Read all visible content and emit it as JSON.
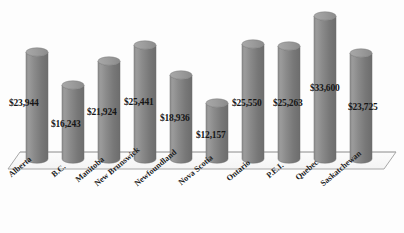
{
  "chart_data": {
    "type": "bar",
    "title": "",
    "subtitle": "",
    "xlabel": "",
    "ylabel": "",
    "grid": false,
    "legend": false,
    "legend_position": "none",
    "bar_style": "3d-cylinder",
    "bar_color": "#808080",
    "bar_top_color": "#9a9a9a",
    "floor_color": "#fafafa",
    "floor_edge_color": "#9b9b9b",
    "text_color": "#161616",
    "ylim": [
      0,
      36000
    ],
    "categories": [
      "Alberta",
      "B.C.",
      "Manitoba",
      "New Brunswick",
      "Newfoundland",
      "Nova Scotia",
      "Ontario",
      "P.E.I.",
      "Quebec",
      "Saskatchewan"
    ],
    "values": [
      23944,
      16243,
      21924,
      25441,
      18936,
      12157,
      25550,
      25263,
      33600,
      23725
    ],
    "data_labels": [
      "$23,944",
      "$16,243",
      "$21,924",
      "$25,441",
      "$18,936",
      "$12,157",
      "$25,550",
      "$25,263",
      "$33,600",
      "$23,725"
    ]
  },
  "bars": [
    {
      "name": "Alberta",
      "label": "$23,944",
      "x": 26,
      "top": 52,
      "width": 22
    },
    {
      "name": "B.C.",
      "label": "$16,243",
      "x": 62,
      "top": 85,
      "width": 22
    },
    {
      "name": "Manitoba",
      "label": "$21,924",
      "x": 98,
      "top": 61,
      "width": 22
    },
    {
      "name": "New Brunswick",
      "label": "$25,441",
      "x": 134,
      "top": 45,
      "width": 22
    },
    {
      "name": "Newfoundland",
      "label": "$18,936",
      "x": 170,
      "top": 75,
      "width": 22
    },
    {
      "name": "Nova Scotia",
      "label": "$12,157",
      "x": 206,
      "top": 103,
      "width": 22
    },
    {
      "name": "Ontario",
      "label": "$25,550",
      "x": 242,
      "top": 44,
      "width": 22
    },
    {
      "name": "P.E.I.",
      "label": "$25,263",
      "x": 278,
      "top": 46,
      "width": 22
    },
    {
      "name": "Quebec",
      "label": "$33,600",
      "x": 314,
      "top": 16,
      "width": 22
    },
    {
      "name": "Saskatchewan",
      "label": "$23,725",
      "x": 350,
      "top": 53,
      "width": 22
    }
  ],
  "value_labels": [
    {
      "text": "$23,944",
      "x": 9,
      "y": 99
    },
    {
      "text": "$16,243",
      "x": 51,
      "y": 120
    },
    {
      "text": "$21,924",
      "x": 87,
      "y": 108
    },
    {
      "text": "$25,441",
      "x": 124,
      "y": 98
    },
    {
      "text": "$18,936",
      "x": 160,
      "y": 114
    },
    {
      "text": "$12,157",
      "x": 196,
      "y": 131
    },
    {
      "text": "$25,550",
      "x": 232,
      "y": 99
    },
    {
      "text": "$25,263",
      "x": 273,
      "y": 99
    },
    {
      "text": "$33,600",
      "x": 310,
      "y": 84
    },
    {
      "text": "$23,725",
      "x": 348,
      "y": 103
    }
  ],
  "category_labels": [
    {
      "text": "Alberta",
      "x": 10,
      "y": 172
    },
    {
      "text": "B.C.",
      "x": 53,
      "y": 172
    },
    {
      "text": "Manitoba",
      "x": 77,
      "y": 177
    },
    {
      "text": "New Brunswick",
      "x": 96,
      "y": 181
    },
    {
      "text": "Newfoundland",
      "x": 136,
      "y": 181
    },
    {
      "text": "Nova Scotia",
      "x": 180,
      "y": 180
    },
    {
      "text": "Ontario",
      "x": 228,
      "y": 176
    },
    {
      "text": "P.E.I.",
      "x": 268,
      "y": 173
    },
    {
      "text": "Quebec",
      "x": 297,
      "y": 175
    },
    {
      "text": "Saskatchewan",
      "x": 322,
      "y": 181
    }
  ]
}
